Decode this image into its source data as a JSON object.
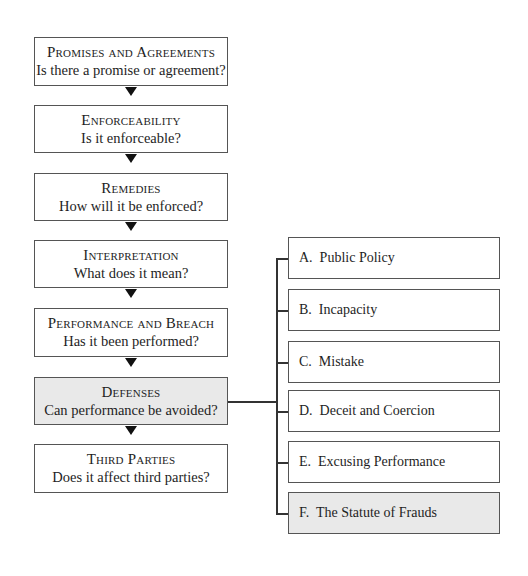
{
  "main_steps": [
    {
      "title": "Promises and Agreements",
      "question": "Is there a promise or agreement?",
      "top": 37,
      "height": 49,
      "shaded": false
    },
    {
      "title": "Enforceability",
      "question": "Is it enforceable?",
      "top": 105,
      "height": 48,
      "shaded": false
    },
    {
      "title": "Remedies",
      "question": "How will it be enforced?",
      "top": 173,
      "height": 48,
      "shaded": false
    },
    {
      "title": "Interpretation",
      "question": "What does it mean?",
      "top": 240,
      "height": 48,
      "shaded": false
    },
    {
      "title": "Performance and Breach",
      "question": "Has it been performed?",
      "top": 308,
      "height": 49,
      "shaded": false
    },
    {
      "title": "Defenses",
      "question": "Can performance be avoided?",
      "top": 377,
      "height": 48,
      "shaded": true
    },
    {
      "title": "Third Parties",
      "question": "Does it affect third parties?",
      "top": 444,
      "height": 49,
      "shaded": false
    }
  ],
  "defenses_subtopics": [
    {
      "label": "A.  Public Policy",
      "top": 237,
      "shaded": false
    },
    {
      "label": "B.  Incapacity",
      "top": 289,
      "shaded": false
    },
    {
      "label": "C.  Mistake",
      "top": 341,
      "shaded": false
    },
    {
      "label": "D.  Deceit and Coercion",
      "top": 390,
      "shaded": false
    },
    {
      "label": "E.  Excusing Performance",
      "top": 441,
      "shaded": false
    },
    {
      "label": "F.  The Statute of Frauds",
      "top": 492,
      "shaded": true
    }
  ],
  "colors": {
    "border": "#555555",
    "highlight_fill": "#e9e9e9",
    "arrow": "#111111"
  }
}
